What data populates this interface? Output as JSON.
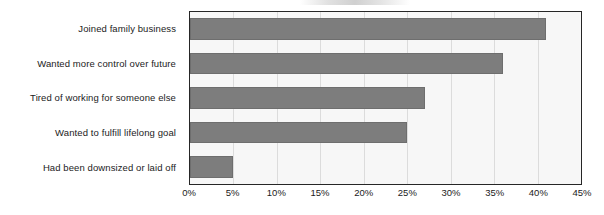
{
  "chart_data": {
    "type": "bar",
    "orientation": "horizontal",
    "title": "",
    "xlabel": "",
    "ylabel": "",
    "categories": [
      "Joined family business",
      "Wanted more control over future",
      "Tired of working for someone else",
      "Wanted to fulfill lifelong goal",
      "Had been downsized or laid off"
    ],
    "values": [
      41,
      36,
      27,
      25,
      5
    ],
    "value_suffix": "%",
    "xlim": [
      0,
      45
    ],
    "xticks": [
      0,
      5,
      10,
      15,
      20,
      25,
      30,
      35,
      40,
      45
    ],
    "xtick_labels": [
      "0%",
      "5%",
      "10%",
      "15%",
      "20%",
      "25%",
      "30%",
      "35%",
      "40%",
      "45%"
    ],
    "grid": "vertical",
    "legend": "none",
    "colors": {
      "bar_fill": "#7d7d7d",
      "bar_border": "#6e6e6e",
      "plot_background": "#f7f7f7",
      "plot_border": "#262626",
      "gridline": "#dcdcdc",
      "text": "#1b1b1b",
      "page_background": "#ffffff"
    }
  }
}
